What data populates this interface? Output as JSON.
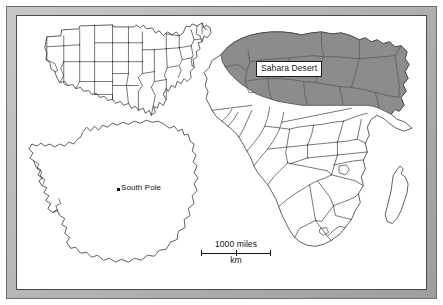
{
  "figure": {
    "type": "reference-map",
    "frame_color": "#b4b4b4",
    "background_color": "#ffffff",
    "outline_color": "#1a1a1a",
    "shaded_region_color": "#8c8c8c"
  },
  "labels": {
    "sahara_desert": "Sahara Desert",
    "south_pole": "South Pole"
  },
  "scalebar": {
    "top_label": "1000 miles",
    "bottom_label": "km"
  },
  "panels": [
    {
      "id": "united-states",
      "name": "United States"
    },
    {
      "id": "antarctica",
      "name": "Antarctica"
    },
    {
      "id": "africa",
      "name": "Africa"
    }
  ]
}
